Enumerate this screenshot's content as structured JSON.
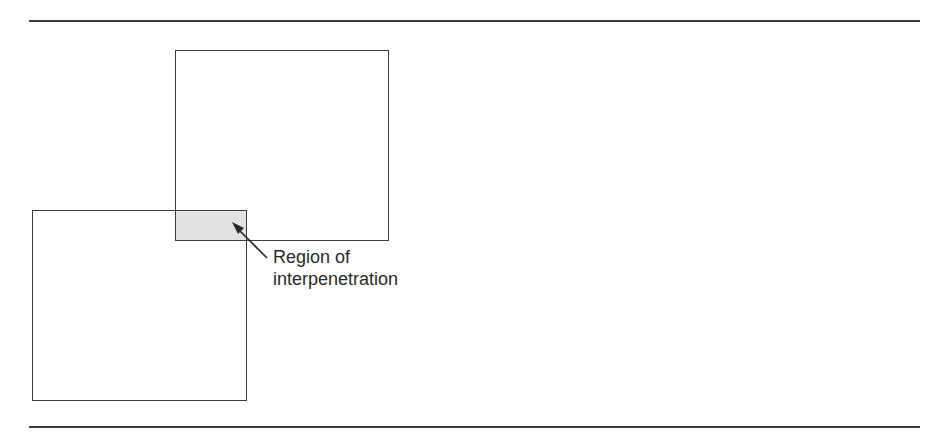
{
  "figure": {
    "label_lines": [
      "Region of",
      "interpenetration"
    ],
    "colors": {
      "stroke": "#3d3d3d",
      "overlap_fill": "#e2e2e2",
      "rule": "#3a3a3a",
      "text": "#2a2a2a"
    },
    "shapes": {
      "upper_square": {
        "x": 175,
        "y": 50,
        "w": 214,
        "h": 191
      },
      "lower_square": {
        "x": 32,
        "y": 210,
        "w": 215,
        "h": 191
      },
      "overlap_region": {
        "x": 176,
        "y": 211,
        "w": 70,
        "h": 29
      }
    }
  }
}
